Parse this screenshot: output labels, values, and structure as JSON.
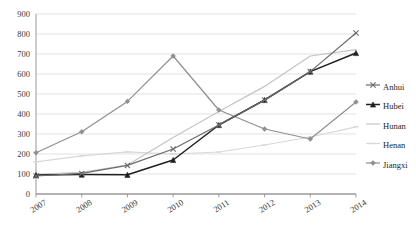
{
  "chart_data": {
    "type": "line",
    "title": "",
    "xlabel": "",
    "ylabel": "",
    "categories": [
      "2007",
      "2008",
      "2009",
      "2010",
      "2011",
      "2012",
      "2013",
      "2014"
    ],
    "ylim": [
      0,
      900
    ],
    "ytick_step": 100,
    "yticks": [
      "0",
      "100",
      "200",
      "300",
      "400",
      "500",
      "600",
      "700",
      "800",
      "900"
    ],
    "grid": true,
    "legend_position": "right",
    "series": [
      {
        "name": "Anhui",
        "color": "#6b6b6b",
        "marker": "x",
        "values": [
          90,
          103,
          143,
          225,
          345,
          470,
          612,
          805
        ]
      },
      {
        "name": "Hubei",
        "color": "#1f1f1f",
        "marker": "triangle",
        "values": [
          95,
          97,
          96,
          170,
          345,
          470,
          612,
          705
        ]
      },
      {
        "name": "Hunan",
        "color": "#c4c4c4",
        "marker": "none",
        "values": [
          98,
          108,
          145,
          283,
          412,
          538,
          690,
          722
        ]
      },
      {
        "name": "Henan",
        "color": "#d8d8d8",
        "marker": "dash",
        "values": [
          161,
          191,
          211,
          200,
          210,
          245,
          285,
          336
        ]
      },
      {
        "name": "Jiangxi",
        "color": "#8f8f8f",
        "marker": "diamond",
        "values": [
          206,
          311,
          463,
          690,
          420,
          325,
          275,
          460
        ]
      }
    ]
  },
  "legend": {
    "items": [
      {
        "label": "Anhui"
      },
      {
        "label": "Hubei"
      },
      {
        "label": "Hunan"
      },
      {
        "label": "Henan"
      },
      {
        "label": "Jiangxi"
      }
    ]
  }
}
